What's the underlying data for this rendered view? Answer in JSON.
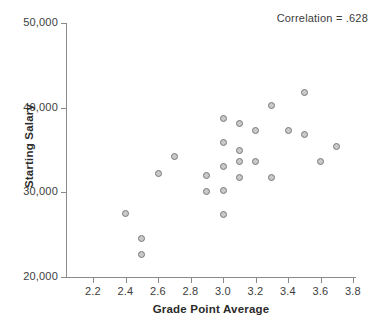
{
  "chart_data": {
    "type": "scatter",
    "title": "",
    "xlabel": "Grade Point Average",
    "ylabel": "Starting Salary",
    "xlim": [
      2.1,
      3.85
    ],
    "ylim": [
      20000,
      50000
    ],
    "grid": false,
    "legend": "none",
    "annotation": "Correlation = .628",
    "correlation": 0.628,
    "xticks": [
      2.2,
      2.4,
      2.6,
      2.8,
      3.0,
      3.2,
      3.4,
      3.6,
      3.8
    ],
    "xtick_labels": [
      "2.2",
      "2.4",
      "2.6",
      "2.8",
      "3.0",
      "3.2",
      "3.4",
      "3.6",
      "3.8"
    ],
    "yticks": [
      20000,
      30000,
      40000,
      50000
    ],
    "ytick_labels": [
      "20,000",
      "30,000",
      "40,000",
      "50,000"
    ],
    "marker_fill": "#c9c9c9",
    "marker_stroke": "#787878",
    "axis_color": "#8a8a8a",
    "points": [
      {
        "x": 2.4,
        "y": 27500
      },
      {
        "x": 2.5,
        "y": 24500
      },
      {
        "x": 2.5,
        "y": 22700
      },
      {
        "x": 2.6,
        "y": 32200
      },
      {
        "x": 2.7,
        "y": 34200
      },
      {
        "x": 2.9,
        "y": 32000
      },
      {
        "x": 2.9,
        "y": 30100
      },
      {
        "x": 3.0,
        "y": 38700
      },
      {
        "x": 3.0,
        "y": 35900
      },
      {
        "x": 3.0,
        "y": 33100
      },
      {
        "x": 3.0,
        "y": 30200
      },
      {
        "x": 3.0,
        "y": 27400
      },
      {
        "x": 3.1,
        "y": 38100
      },
      {
        "x": 3.1,
        "y": 34900
      },
      {
        "x": 3.1,
        "y": 33600
      },
      {
        "x": 3.1,
        "y": 31800
      },
      {
        "x": 3.2,
        "y": 37300
      },
      {
        "x": 3.2,
        "y": 33600
      },
      {
        "x": 3.3,
        "y": 40200
      },
      {
        "x": 3.3,
        "y": 31700
      },
      {
        "x": 3.4,
        "y": 37300
      },
      {
        "x": 3.5,
        "y": 41800
      },
      {
        "x": 3.5,
        "y": 36800
      },
      {
        "x": 3.6,
        "y": 33600
      },
      {
        "x": 3.7,
        "y": 35400
      }
    ]
  }
}
